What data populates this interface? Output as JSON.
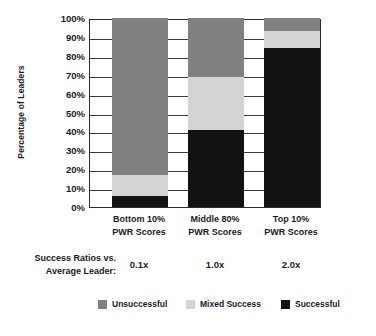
{
  "chart_data": {
    "type": "bar",
    "subtype": "stacked-bar-100pct",
    "title": "",
    "xlabel": "",
    "ylabel": "Percentage of Leaders",
    "ylim": [
      0,
      100
    ],
    "ytick_labels": [
      "100%",
      "90%",
      "80%",
      "70%",
      "60%",
      "50%",
      "40%",
      "30%",
      "20%",
      "10%",
      "0%"
    ],
    "ytick_values": [
      100,
      90,
      80,
      70,
      60,
      50,
      40,
      30,
      20,
      10,
      0
    ],
    "grid": true,
    "legend_position": "bottom",
    "categories": [
      "Bottom 10% PWR Scores",
      "Middle 80% PWR Scores",
      "Top 10% PWR Scores"
    ],
    "category_lines": [
      [
        "Bottom 10%",
        "PWR Scores"
      ],
      [
        "Middle 80%",
        "PWR Scores"
      ],
      [
        "Top 10%",
        "PWR Scores"
      ]
    ],
    "series": [
      {
        "name": "Unsuccessful",
        "color": "#808080",
        "values": [
          83,
          31,
          7
        ]
      },
      {
        "name": "Mixed Success",
        "color": "#d4d4d4",
        "values": [
          11,
          28,
          9
        ]
      },
      {
        "name": "Successful",
        "color": "#111111",
        "values": [
          6,
          41,
          84
        ]
      }
    ],
    "stack_order_bottom_to_top": [
      "Successful",
      "Mixed Success",
      "Unsuccessful"
    ],
    "annotation_row": {
      "label_lines": [
        "Success Ratios vs.",
        "Average Leader:"
      ],
      "values": [
        "0.1x",
        "1.0x",
        "2.0x"
      ]
    }
  },
  "legend": {
    "items": [
      {
        "label": "Unsuccessful",
        "color": "#808080"
      },
      {
        "label": "Mixed Success",
        "color": "#d4d4d4"
      },
      {
        "label": "Successful",
        "color": "#111111"
      }
    ]
  },
  "colors": {
    "unsuccessful": "#808080",
    "mixed_success": "#d4d4d4",
    "successful": "#111111",
    "axis": "#2b2b2b",
    "background": "#ffffff"
  }
}
